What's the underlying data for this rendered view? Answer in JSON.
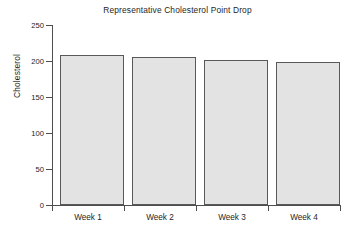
{
  "chart_data": {
    "type": "bar",
    "title": "Representative Cholesterol Point Drop",
    "xlabel": "",
    "ylabel": "Cholesterol",
    "categories": [
      "Week 1",
      "Week 2",
      "Week 3",
      "Week 4"
    ],
    "values": [
      209,
      205,
      202,
      198
    ],
    "ylim": [
      0,
      250
    ],
    "ytick_labels": [
      "0",
      "50",
      "100",
      "150",
      "200",
      "250"
    ],
    "ytick_values": [
      0,
      50,
      100,
      150,
      200,
      250
    ],
    "grid": false,
    "legend": null,
    "bar_fill_color": "#e3e3e3",
    "bar_edge_color": "#595959",
    "axis_color": "#4e4e4e",
    "background_color": "#ffffff"
  }
}
